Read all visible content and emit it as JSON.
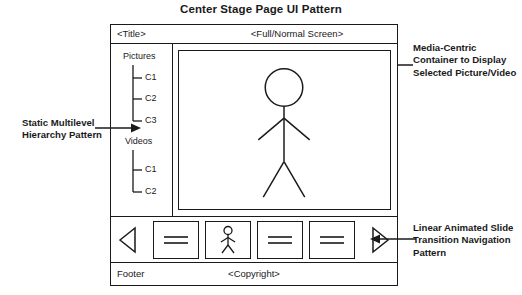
{
  "diagram": {
    "title": "Center Stage Page UI Pattern"
  },
  "frame": {
    "title_bar": {
      "title": "<Title>",
      "fullscreen": "<Full/Normal Screen>"
    },
    "sidebar": {
      "groups": [
        {
          "label": "Pictures",
          "children": [
            {
              "label": "C1"
            },
            {
              "label": "C2"
            },
            {
              "label": "C3"
            }
          ]
        },
        {
          "label": "Videos",
          "children": [
            {
              "label": "C1"
            },
            {
              "label": "C2"
            }
          ]
        }
      ]
    },
    "stage": {
      "content_icon": "stick-figure-person"
    },
    "nav_bar": {
      "prev_icon": "triangle-left-icon",
      "next_icon": "triangle-right-icon",
      "thumbnails": [
        {
          "icon": "equals-lines-icon"
        },
        {
          "icon": "stick-figure-person-icon"
        },
        {
          "icon": "equals-lines-icon"
        },
        {
          "icon": "equals-lines-icon"
        }
      ]
    },
    "footer": {
      "left": "Footer",
      "center": "<Copyright>"
    }
  },
  "annotations": {
    "left": "Static Multilevel Hierarchy Pattern",
    "right_top": "Media-Centric Container to Display Selected Picture/Video",
    "right_bottom": "Linear Animated Slide Transition Navigation Pattern"
  },
  "colors": {
    "ink": "#1a1a1a",
    "background": "#ffffff"
  }
}
